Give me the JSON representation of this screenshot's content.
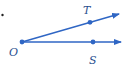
{
  "diagram": {
    "type": "angle",
    "colors": {
      "ray": "#2f66c4",
      "label": "#2a4f8f",
      "dot": "#222222"
    },
    "vertex": {
      "label": "O"
    },
    "rays": [
      {
        "name": "ray-OT",
        "point_label": "T"
      },
      {
        "name": "ray-OS",
        "point_label": "S"
      }
    ]
  }
}
